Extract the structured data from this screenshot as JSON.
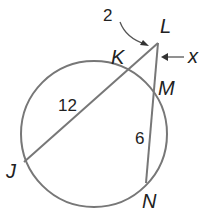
{
  "diagram": {
    "type": "circle-secants",
    "circle": {
      "cx": 94,
      "cy": 134,
      "r": 73
    },
    "points": {
      "L": {
        "label": "L",
        "x": 158,
        "y": 43
      },
      "K": {
        "label": "K",
        "x": 128,
        "y": 71
      },
      "M": {
        "label": "M",
        "x": 154,
        "y": 81
      },
      "J": {
        "label": "J",
        "x": 24,
        "y": 162
      },
      "N": {
        "label": "N",
        "x": 146,
        "y": 183
      }
    },
    "segments": {
      "LK": "2",
      "KJ": "12",
      "LM": "x",
      "MN": "6"
    },
    "colors": {
      "line": "#777777",
      "text": "#222222"
    }
  }
}
